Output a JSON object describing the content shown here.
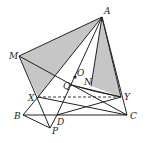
{
  "diagram": {
    "type": "geometry",
    "points": {
      "A": [
        102,
        17
      ],
      "M": [
        19,
        56
      ],
      "X": [
        38,
        97
      ],
      "Y": [
        121,
        97
      ],
      "B": [
        23,
        115
      ],
      "C": [
        127,
        115
      ],
      "D": [
        57,
        115
      ],
      "P": [
        50,
        128
      ],
      "O": [
        75,
        77
      ],
      "Q": [
        71,
        85
      ],
      "N": [
        91,
        86
      ]
    },
    "labels": {
      "A": "A",
      "M": "M",
      "O": "O",
      "Q": "Q",
      "N": "N",
      "X": "X",
      "Y": "Y",
      "B": "B",
      "C": "C",
      "D": "D",
      "P": "P"
    },
    "colors": {
      "shade": "#c6c6c6",
      "line": "#222222"
    }
  }
}
